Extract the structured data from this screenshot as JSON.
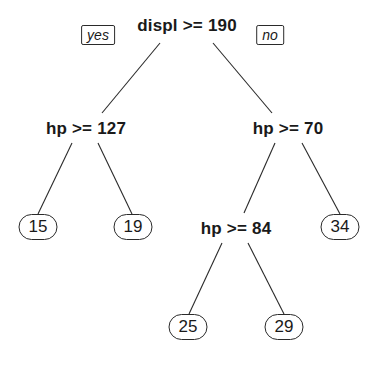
{
  "tree": {
    "root": {
      "label": "displ >= 190",
      "x": 187,
      "y": 25
    },
    "branch_labels": {
      "yes": {
        "label": "yes",
        "x": 98,
        "y": 35
      },
      "no": {
        "label": "no",
        "x": 270,
        "y": 35
      }
    },
    "nodes": {
      "n2": {
        "label": "hp >= 127",
        "x": 86,
        "y": 128
      },
      "n3": {
        "label": "hp >= 70",
        "x": 288,
        "y": 128
      },
      "n7": {
        "label": "hp >= 84",
        "x": 236,
        "y": 228
      }
    },
    "leaves": {
      "l4": {
        "value": "15",
        "x": 38,
        "y": 227
      },
      "l5": {
        "value": "19",
        "x": 133,
        "y": 227
      },
      "l6": {
        "value": "34",
        "x": 340,
        "y": 227
      },
      "l14": {
        "value": "25",
        "x": 188,
        "y": 327
      },
      "l15": {
        "value": "29",
        "x": 284,
        "y": 327
      }
    },
    "edges": [
      {
        "from": "root",
        "to": "n2",
        "x1": 160,
        "y1": 43,
        "x2": 102,
        "y2": 113
      },
      {
        "from": "root",
        "to": "n3",
        "x1": 213,
        "y1": 43,
        "x2": 272,
        "y2": 113
      },
      {
        "from": "n2",
        "to": "l4",
        "x1": 72,
        "y1": 143,
        "x2": 38,
        "y2": 214
      },
      {
        "from": "n2",
        "to": "l5",
        "x1": 98,
        "y1": 143,
        "x2": 132,
        "y2": 214
      },
      {
        "from": "n3",
        "to": "n7",
        "x1": 275,
        "y1": 143,
        "x2": 244,
        "y2": 213
      },
      {
        "from": "n3",
        "to": "l6",
        "x1": 302,
        "y1": 143,
        "x2": 340,
        "y2": 214
      },
      {
        "from": "n7",
        "to": "l14",
        "x1": 222,
        "y1": 243,
        "x2": 189,
        "y2": 314
      },
      {
        "from": "n7",
        "to": "l15",
        "x1": 248,
        "y1": 243,
        "x2": 284,
        "y2": 314
      }
    ]
  }
}
